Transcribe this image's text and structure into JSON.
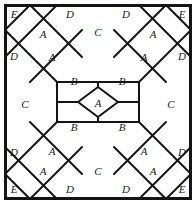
{
  "figure": {
    "width": 196,
    "height": 204,
    "background_color": "#ffffff",
    "line_color": "#141414",
    "label_color": "#1a1a1a",
    "symmetry": "4-fold (horizontal, vertical and diagonal mirror symmetry)",
    "frame": {
      "name": "outer-square-border",
      "stroke_width": 3,
      "x": 4,
      "y": 4,
      "width": 188,
      "height": 196
    }
  },
  "legend": {
    "shape_types": [
      {
        "letter": "A",
        "shape": "square rotated 45 degrees (diamond)",
        "count": 9
      },
      {
        "letter": "B",
        "shape": "pentagon",
        "count": 4
      },
      {
        "letter": "C",
        "shape": "elongated hexagon",
        "count": 4
      },
      {
        "letter": "D",
        "shape": "right triangle on edge midpoint",
        "count": 8
      },
      {
        "letter": "E",
        "shape": "small corner triangle",
        "count": 4
      }
    ]
  },
  "labels": [
    {
      "id": "E-top-left",
      "text": "E",
      "x": 14,
      "y": 15
    },
    {
      "id": "A-top-left",
      "text": "A",
      "x": 43,
      "y": 35
    },
    {
      "id": "D-top-left",
      "text": "D",
      "x": 70,
      "y": 15
    },
    {
      "id": "C-top",
      "text": "C",
      "x": 98,
      "y": 33
    },
    {
      "id": "D-top-right",
      "text": "D",
      "x": 126,
      "y": 15
    },
    {
      "id": "A-top-right",
      "text": "A",
      "x": 153,
      "y": 35
    },
    {
      "id": "E-top-right",
      "text": "E",
      "x": 182,
      "y": 15
    },
    {
      "id": "D-left-top",
      "text": "D",
      "x": 14,
      "y": 57
    },
    {
      "id": "A-upper-left-in",
      "text": "A",
      "x": 52,
      "y": 58
    },
    {
      "id": "A-upper-right-in",
      "text": "A",
      "x": 144,
      "y": 58
    },
    {
      "id": "D-right-top",
      "text": "D",
      "x": 182,
      "y": 57
    },
    {
      "id": "B-top-left",
      "text": "B",
      "x": 74,
      "y": 82
    },
    {
      "id": "B-top-right",
      "text": "B",
      "x": 122,
      "y": 82
    },
    {
      "id": "C-left",
      "text": "C",
      "x": 25,
      "y": 105
    },
    {
      "id": "A-center",
      "text": "A",
      "x": 98,
      "y": 104
    },
    {
      "id": "C-right",
      "text": "C",
      "x": 171,
      "y": 105
    },
    {
      "id": "B-bottom-left",
      "text": "B",
      "x": 74,
      "y": 128
    },
    {
      "id": "B-bottom-right",
      "text": "B",
      "x": 122,
      "y": 128
    },
    {
      "id": "D-left-bottom",
      "text": "D",
      "x": 14,
      "y": 153
    },
    {
      "id": "A-lower-left-in",
      "text": "A",
      "x": 52,
      "y": 152
    },
    {
      "id": "A-lower-right-in",
      "text": "A",
      "x": 144,
      "y": 152
    },
    {
      "id": "D-right-bottom",
      "text": "D",
      "x": 182,
      "y": 153
    },
    {
      "id": "E-bottom-left",
      "text": "E",
      "x": 14,
      "y": 190
    },
    {
      "id": "A-bottom-left",
      "text": "A",
      "x": 43,
      "y": 172
    },
    {
      "id": "D-bottom-left",
      "text": "D",
      "x": 70,
      "y": 190
    },
    {
      "id": "C-bottom",
      "text": "C",
      "x": 98,
      "y": 172
    },
    {
      "id": "D-bottom-right",
      "text": "D",
      "x": 126,
      "y": 190
    },
    {
      "id": "A-bottom-right",
      "text": "A",
      "x": 153,
      "y": 172
    },
    {
      "id": "E-bottom-right",
      "text": "E",
      "x": 182,
      "y": 190
    }
  ],
  "edges": [
    {
      "id": "diag-tl-1",
      "d": "M 5 30 L 30 5"
    },
    {
      "id": "diag-tl-2",
      "d": "M 5 57 L 57 5"
    },
    {
      "id": "diag-tl-3",
      "d": "M 30 82 L 82 30"
    },
    {
      "id": "diag-tl-x",
      "d": "M 5 30 L 57 82"
    },
    {
      "id": "diag-tl-y",
      "d": "M 30 5 L 82 57"
    },
    {
      "id": "diag-tr-1",
      "d": "M 191 30 L 166 5"
    },
    {
      "id": "diag-tr-2",
      "d": "M 191 57 L 139 5"
    },
    {
      "id": "diag-tr-3",
      "d": "M 166 82 L 114 30"
    },
    {
      "id": "diag-tr-x",
      "d": "M 191 30 L 139 82"
    },
    {
      "id": "diag-tr-y",
      "d": "M 166 5 L 114 57"
    },
    {
      "id": "diag-bl-1",
      "d": "M 5 174 L 30 199"
    },
    {
      "id": "diag-bl-2",
      "d": "M 5 147 L 57 199"
    },
    {
      "id": "diag-bl-3",
      "d": "M 30 122 L 82 174"
    },
    {
      "id": "diag-bl-x",
      "d": "M 5 174 L 57 122"
    },
    {
      "id": "diag-bl-y",
      "d": "M 30 199 L 82 147"
    },
    {
      "id": "diag-br-1",
      "d": "M 191 174 L 166 199"
    },
    {
      "id": "diag-br-2",
      "d": "M 191 147 L 139 199"
    },
    {
      "id": "diag-br-3",
      "d": "M 166 122 L 114 174"
    },
    {
      "id": "diag-br-x",
      "d": "M 191 174 L 139 122"
    },
    {
      "id": "diag-br-y",
      "d": "M 166 199 L 114 147"
    },
    {
      "id": "oct-top",
      "d": "M 57 82 L 139 82"
    },
    {
      "id": "oct-bottom",
      "d": "M 57 122 L 139 122"
    },
    {
      "id": "oct-left",
      "d": "M 57 82 L 57 122"
    },
    {
      "id": "oct-right",
      "d": "M 139 82 L 139 122"
    },
    {
      "id": "inner-cross-up",
      "d": "M 98 82 L 98 87"
    },
    {
      "id": "inner-cross-down",
      "d": "M 98 117 L 98 122"
    },
    {
      "id": "inner-cross-left",
      "d": "M 57 102 L 78 102"
    },
    {
      "id": "inner-cross-right",
      "d": "M 118 102 L 139 102"
    },
    {
      "id": "center-diamond",
      "d": "M 98 87 L 118 102 L 98 117 L 78 102 Z"
    },
    {
      "id": "b-split-tl",
      "d": "M 98 87 L 78 102"
    },
    {
      "id": "b-split-tr",
      "d": "M 98 87 L 118 102"
    },
    {
      "id": "b-split-bl",
      "d": "M 98 117 L 78 102"
    },
    {
      "id": "b-split-br",
      "d": "M 98 117 L 118 102"
    }
  ]
}
